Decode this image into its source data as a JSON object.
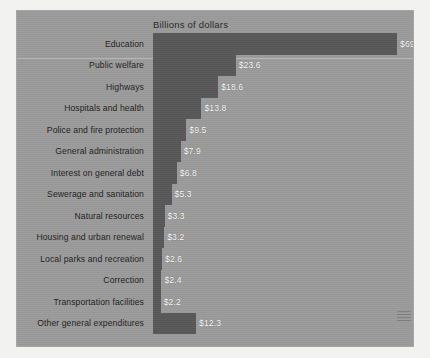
{
  "chart_data": {
    "type": "bar",
    "orientation": "horizontal",
    "title": "Billions of dollars",
    "xlabel": "",
    "ylabel": "",
    "xlim": [
      0,
      69.6
    ],
    "grid": false,
    "legend": null,
    "categories": [
      "Education",
      "Public welfare",
      "Highways",
      "Hospitals and health",
      "Police and fire protection",
      "General administration",
      "Interest on general debt",
      "Sewerage and sanitation",
      "Natural resources",
      "Housing and urban renewal",
      "Local parks and recreation",
      "Correction",
      "Transportation facilities",
      "Other general expenditures"
    ],
    "values": [
      69.6,
      23.6,
      18.6,
      13.8,
      9.5,
      7.9,
      6.8,
      5.3,
      3.3,
      3.2,
      2.6,
      2.4,
      2.2,
      12.3
    ],
    "value_labels": [
      "$69.6",
      "$23.6",
      "$18.6",
      "$13.8",
      "$9.5",
      "$7.9",
      "$6.8",
      "$5.3",
      "$3.3",
      "$3.2",
      "$2.6",
      "$2.4",
      "$2.2",
      "$12.3"
    ],
    "colors": {
      "bar": "#585858",
      "background": "#9b9b9b",
      "page": "#f2f2f0",
      "category_text": "#1e1e20",
      "value_text": "#ffffff",
      "title_text": "#28282a"
    }
  }
}
